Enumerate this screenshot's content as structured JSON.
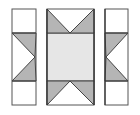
{
  "diagram": {
    "type": "quilt-block-exploded",
    "colors": {
      "background": "#ffffff",
      "outline": "#555555",
      "triangle_fill": "#b5b5b5",
      "center_fill": "#e6e6e6",
      "patch_fill": "#ffffff"
    },
    "pieces": [
      {
        "name": "left-strip",
        "x": 12,
        "y": 9,
        "w": 24,
        "h": 96
      },
      {
        "name": "center-column",
        "x": 47,
        "y": 9,
        "w": 47,
        "h": 96
      },
      {
        "name": "right-strip",
        "x": 105,
        "y": 9,
        "w": 23,
        "h": 96
      }
    ]
  }
}
